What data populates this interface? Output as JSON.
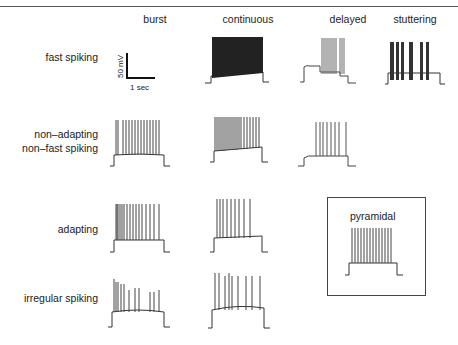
{
  "figure": {
    "header_fragment": "spiking",
    "columns": [
      "burst",
      "continuous",
      "delayed",
      "stuttering"
    ],
    "rows": [
      {
        "label_lines": [
          "fast spiking"
        ]
      },
      {
        "label_lines": [
          "non–adapting",
          "non–fast spiking"
        ]
      },
      {
        "label_lines": [
          "adapting"
        ]
      },
      {
        "label_lines": [
          "irregular spiking"
        ]
      }
    ],
    "scale_bar": {
      "vertical": "50 mV",
      "horizontal": "1 sec"
    },
    "inset": {
      "label": "pyramidal"
    },
    "cells": [
      {
        "row": "fast spiking",
        "col": "burst",
        "content": "scale bar"
      },
      {
        "row": "fast spiking",
        "col": "continuous",
        "pattern": "dense continuous high-frequency firing"
      },
      {
        "row": "fast spiking",
        "col": "delayed",
        "pattern": "delayed onset then high-frequency spikes"
      },
      {
        "row": "fast spiking",
        "col": "stuttering",
        "pattern": "clusters of spikes separated by pauses"
      },
      {
        "row": "non–adapting non–fast spiking",
        "col": "burst",
        "pattern": "initial burst then regular spikes"
      },
      {
        "row": "non–adapting non–fast spiking",
        "col": "continuous",
        "pattern": "regular sustained firing"
      },
      {
        "row": "non–adapting non–fast spiking",
        "col": "delayed",
        "pattern": "delayed regular spikes"
      },
      {
        "row": "adapting",
        "col": "burst",
        "pattern": "initial burst with adapting spikes"
      },
      {
        "row": "adapting",
        "col": "continuous",
        "pattern": "adapting sustained firing"
      },
      {
        "row": "irregular spiking",
        "col": "burst",
        "pattern": "initial burst then irregular spikes"
      },
      {
        "row": "irregular spiking",
        "col": "continuous",
        "pattern": "irregular spikes"
      }
    ]
  }
}
